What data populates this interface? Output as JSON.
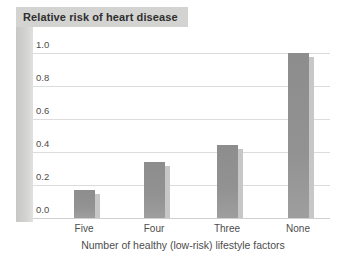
{
  "chart_data": {
    "type": "bar",
    "title": "Relative risk of heart disease",
    "xlabel": "Number of healthy (low-risk) lifestyle factors",
    "ylabel": "Relative risk of heart disease",
    "categories": [
      "Five",
      "Four",
      "Three",
      "None"
    ],
    "values": [
      0.17,
      0.34,
      0.44,
      1.0
    ],
    "ylim": [
      0,
      1.0
    ],
    "ytick_labels": [
      "1.0",
      "0.8",
      "0.6",
      "0.4",
      "0.2",
      "0.0"
    ],
    "grid": true,
    "legend": false
  },
  "colors": {
    "background": "#ffffff",
    "bar": "#929292",
    "bar_shadow": "#c7c7c7",
    "title_box_bg": "#d3d3d1",
    "side_strip": "#cdcdcb",
    "gridline": "#dcdcdc",
    "axis_line": "#d0d0d0",
    "label_text": "#4d4d4d",
    "title_text": "#2f2f2f"
  }
}
